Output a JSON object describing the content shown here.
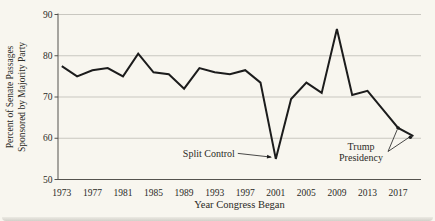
{
  "chart_data": {
    "type": "line",
    "title": "",
    "x": [
      1973,
      1975,
      1977,
      1979,
      1981,
      1983,
      1985,
      1987,
      1989,
      1991,
      1993,
      1995,
      1997,
      1999,
      2001,
      2003,
      2005,
      2007,
      2009,
      2011,
      2013,
      2015,
      2017,
      2019
    ],
    "values": [
      77.5,
      75,
      76.5,
      77,
      75,
      80.5,
      76,
      75.5,
      72,
      77,
      76,
      75.5,
      76.5,
      73.5,
      55,
      69.5,
      73.5,
      71,
      86.5,
      70.5,
      71.5,
      67,
      62.5,
      60.5
    ],
    "xlabel": "Year Congress Began",
    "ylabel_line1": "Percent of Senate Passages",
    "ylabel_line2": "Sponsored by Majority Party",
    "xlim": [
      1972.5,
      2020
    ],
    "ylim": [
      50,
      90
    ],
    "yticks": [
      50,
      60,
      70,
      80,
      90
    ],
    "xticks": [
      1973,
      1977,
      1981,
      1985,
      1989,
      1993,
      1997,
      2001,
      2005,
      2009,
      2013,
      2017
    ],
    "grid": "horizontal-major",
    "legend": "none",
    "annotations": [
      {
        "id": "split-control",
        "text": "Split Control",
        "target_year": 2001,
        "target_value": 55,
        "marker": "arrow"
      },
      {
        "id": "trump-presidency",
        "text_line1": "Trump",
        "text_line2": "Presidency",
        "targets": [
          {
            "year": 2017,
            "value": 62.5
          },
          {
            "year": 2019,
            "value": 60.5
          }
        ],
        "marker": "dot"
      }
    ],
    "colors": {
      "line": "#1c1c1c",
      "grid": "#c9c7c0",
      "axis": "#55534e",
      "text": "#2b2a26",
      "background": "#f8f6ef"
    }
  }
}
